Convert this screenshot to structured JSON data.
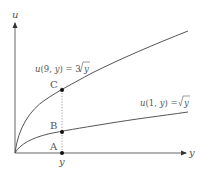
{
  "diagram": {
    "axes": {
      "vertical_label": "u",
      "horizontal_label": "y",
      "origin": [
        15,
        153
      ],
      "vertical_end": [
        15,
        22
      ],
      "horizontal_end": [
        186,
        153
      ]
    },
    "curves": [
      {
        "id": "upper",
        "label": "u(9, y) = 3√y",
        "label_parts": {
          "prefix": "u(9, y) = 3",
          "radicand": "y"
        },
        "scale": 3
      },
      {
        "id": "lower",
        "label": "u(1, y) = √y",
        "label_parts": {
          "prefix": "u(1, y) = ",
          "radicand": "y"
        },
        "scale": 1
      }
    ],
    "points": [
      {
        "name": "A",
        "x": 62,
        "y": 153
      },
      {
        "name": "B",
        "x": 62,
        "y": 132
      },
      {
        "name": "C",
        "x": 62,
        "y": 90
      }
    ],
    "guide_label": "y",
    "colors": {
      "curve": "#555555",
      "axis": "#555555",
      "point": "#111111",
      "guide": "#888888",
      "text": "#555555"
    }
  }
}
